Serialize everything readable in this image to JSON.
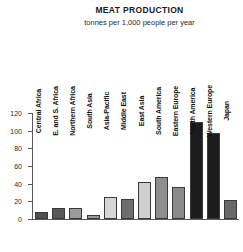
{
  "chart_data": {
    "type": "bar",
    "title": "MEAT PRODUCTION",
    "subtitle": "tonnes per 1,000 people per year",
    "xlabel": "",
    "ylabel": "",
    "ylim": [
      0,
      120
    ],
    "yticks": [
      0,
      20,
      40,
      60,
      80,
      100,
      120
    ],
    "grid": false,
    "legend": "none",
    "categories": [
      "Central Africa",
      "E. and S. Africa",
      "Northern Africa",
      "South Asia",
      "Asia-Pacific",
      "Middle East",
      "East Asia",
      "South America",
      "Eastern Europe",
      "North America",
      "Western Europe",
      "Japan"
    ],
    "values": [
      8,
      13,
      12,
      5,
      25,
      23,
      42,
      48,
      36,
      110,
      97,
      22
    ],
    "bar_colors": [
      "#4f4f4f",
      "#595959",
      "#9c9c9c",
      "#9a9a9a",
      "#d6d6d6",
      "#6e6e6e",
      "#cfcfcf",
      "#8e8e8e",
      "#8a8a8a",
      "#1c1c1c",
      "#1c1c1c",
      "#686868"
    ]
  }
}
